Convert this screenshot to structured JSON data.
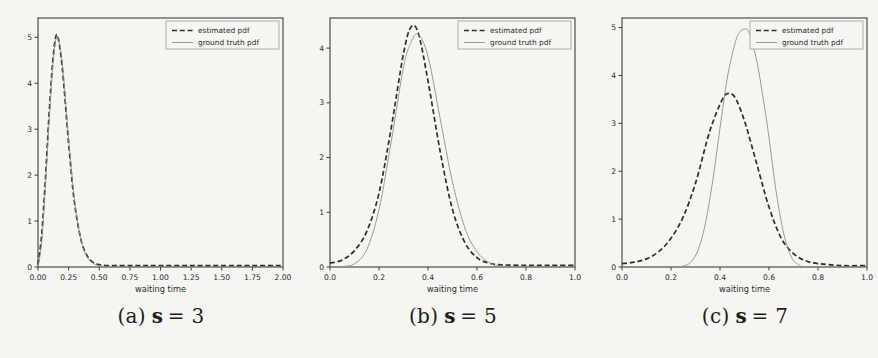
{
  "figure": {
    "xlabel": "waiting time",
    "legend_labels": [
      "estimated pdf",
      "ground truth pdf"
    ]
  },
  "colors": {
    "background": "#f6f5f1",
    "estimated": "#2e2e2e",
    "ground_truth": "#8f8f8f",
    "spine": "#3c3c3c",
    "text": "#2b2b2b",
    "legend_border": "#9a9a9a"
  },
  "captions": [
    {
      "prefix": "(a)",
      "variable": "s",
      "rest": "= 3"
    },
    {
      "prefix": "(b)",
      "variable": "s",
      "rest": "= 5"
    },
    {
      "prefix": "(c)",
      "variable": "s",
      "rest": "= 7"
    }
  ],
  "chart_data": [
    {
      "type": "line",
      "title": "",
      "xlabel": "waiting time",
      "ylabel": "",
      "xlim": [
        0,
        2
      ],
      "ylim": [
        0,
        5.42
      ],
      "grid": false,
      "legend_position": "upper right",
      "xticks": [
        0,
        0.25,
        0.5,
        0.75,
        1.0,
        1.25,
        1.5,
        1.75,
        2.0
      ],
      "xtick_labels": [
        "0.00",
        "0.25",
        "0.50",
        "0.75",
        "1.00",
        "1.25",
        "1.50",
        "1.75",
        "2.00"
      ],
      "yticks": [
        0,
        1,
        2,
        3,
        4,
        5
      ],
      "ytick_labels": [
        "0",
        "1",
        "2",
        "3",
        "4",
        "5"
      ],
      "series": [
        {
          "name": "estimated pdf",
          "style": "dashed",
          "x": [
            0.0,
            0.03,
            0.06,
            0.09,
            0.12,
            0.15,
            0.18,
            0.21,
            0.24,
            0.27,
            0.3,
            0.35,
            0.4,
            0.45,
            0.5,
            0.6,
            0.8,
            1.0,
            1.25,
            1.5,
            1.75,
            2.0
          ],
          "y": [
            0.05,
            0.7,
            1.9,
            3.3,
            4.45,
            5.05,
            4.75,
            4.0,
            3.0,
            2.1,
            1.35,
            0.6,
            0.25,
            0.1,
            0.05,
            0.03,
            0.03,
            0.03,
            0.03,
            0.03,
            0.03,
            0.03
          ]
        },
        {
          "name": "ground truth pdf",
          "style": "solid",
          "x": [
            0.0,
            0.03,
            0.06,
            0.09,
            0.12,
            0.15,
            0.18,
            0.21,
            0.24,
            0.27,
            0.3,
            0.35,
            0.4,
            0.45,
            0.5,
            0.6,
            0.8,
            1.0,
            1.25,
            1.5,
            1.75,
            2.0
          ],
          "y": [
            0.0,
            0.55,
            1.75,
            3.15,
            4.35,
            5.0,
            4.8,
            4.1,
            3.1,
            2.2,
            1.4,
            0.6,
            0.22,
            0.08,
            0.03,
            0.0,
            0.0,
            0.0,
            0.0,
            0.0,
            0.0,
            0.0
          ]
        }
      ]
    },
    {
      "type": "line",
      "title": "",
      "xlabel": "waiting time",
      "ylabel": "",
      "xlim": [
        0,
        1
      ],
      "ylim": [
        0,
        4.55
      ],
      "grid": false,
      "legend_position": "upper right",
      "xticks": [
        0,
        0.2,
        0.4,
        0.6,
        0.8,
        1.0
      ],
      "xtick_labels": [
        "0.0",
        "0.2",
        "0.4",
        "0.6",
        "0.8",
        "1.0"
      ],
      "yticks": [
        0,
        1,
        2,
        3,
        4
      ],
      "ytick_labels": [
        "0",
        "1",
        "2",
        "3",
        "4"
      ],
      "series": [
        {
          "name": "estimated pdf",
          "style": "dashed",
          "x": [
            0.0,
            0.05,
            0.1,
            0.15,
            0.2,
            0.25,
            0.3,
            0.33,
            0.36,
            0.4,
            0.45,
            0.5,
            0.55,
            0.6,
            0.65,
            0.7,
            0.8,
            0.9,
            1.0
          ],
          "y": [
            0.07,
            0.13,
            0.3,
            0.65,
            1.35,
            2.55,
            3.9,
            4.38,
            4.28,
            3.4,
            2.1,
            1.05,
            0.45,
            0.17,
            0.07,
            0.04,
            0.03,
            0.03,
            0.03
          ]
        },
        {
          "name": "ground truth pdf",
          "style": "solid",
          "x": [
            0.0,
            0.05,
            0.1,
            0.15,
            0.2,
            0.25,
            0.3,
            0.33,
            0.36,
            0.4,
            0.45,
            0.5,
            0.55,
            0.6,
            0.65,
            0.7,
            0.8,
            0.9,
            1.0
          ],
          "y": [
            0.0,
            0.01,
            0.06,
            0.32,
            1.05,
            2.3,
            3.65,
            4.1,
            4.25,
            3.85,
            2.7,
            1.55,
            0.72,
            0.28,
            0.08,
            0.01,
            0.0,
            0.0,
            0.0
          ]
        }
      ]
    },
    {
      "type": "line",
      "title": "",
      "xlabel": "waiting time",
      "ylabel": "",
      "xlim": [
        0,
        1
      ],
      "ylim": [
        0,
        5.2
      ],
      "grid": false,
      "legend_position": "upper right",
      "xticks": [
        0,
        0.2,
        0.4,
        0.6,
        0.8,
        1.0
      ],
      "xtick_labels": [
        "0.0",
        "0.2",
        "0.4",
        "0.6",
        "0.8",
        "1.0"
      ],
      "yticks": [
        0,
        1,
        2,
        3,
        4,
        5
      ],
      "ytick_labels": [
        "0",
        "1",
        "2",
        "3",
        "4",
        "5"
      ],
      "series": [
        {
          "name": "estimated pdf",
          "style": "dashed",
          "x": [
            0.0,
            0.05,
            0.1,
            0.15,
            0.2,
            0.25,
            0.3,
            0.35,
            0.38,
            0.41,
            0.43,
            0.46,
            0.5,
            0.55,
            0.6,
            0.65,
            0.7,
            0.75,
            0.8,
            0.9,
            1.0
          ],
          "y": [
            0.07,
            0.1,
            0.17,
            0.32,
            0.6,
            1.05,
            1.75,
            2.7,
            3.15,
            3.5,
            3.62,
            3.55,
            3.05,
            2.15,
            1.25,
            0.6,
            0.28,
            0.13,
            0.07,
            0.03,
            0.03
          ]
        },
        {
          "name": "ground truth pdf",
          "style": "solid",
          "x": [
            0.0,
            0.1,
            0.2,
            0.25,
            0.28,
            0.31,
            0.34,
            0.37,
            0.4,
            0.43,
            0.46,
            0.48,
            0.5,
            0.52,
            0.55,
            0.58,
            0.6,
            0.63,
            0.66,
            0.69,
            0.72,
            0.75,
            0.85,
            1.0
          ],
          "y": [
            0.0,
            0.0,
            0.0,
            0.02,
            0.1,
            0.35,
            0.9,
            1.8,
            2.9,
            3.95,
            4.65,
            4.9,
            4.97,
            4.88,
            4.3,
            3.4,
            2.7,
            1.55,
            0.7,
            0.22,
            0.05,
            0.0,
            0.0,
            0.0
          ]
        }
      ]
    }
  ]
}
